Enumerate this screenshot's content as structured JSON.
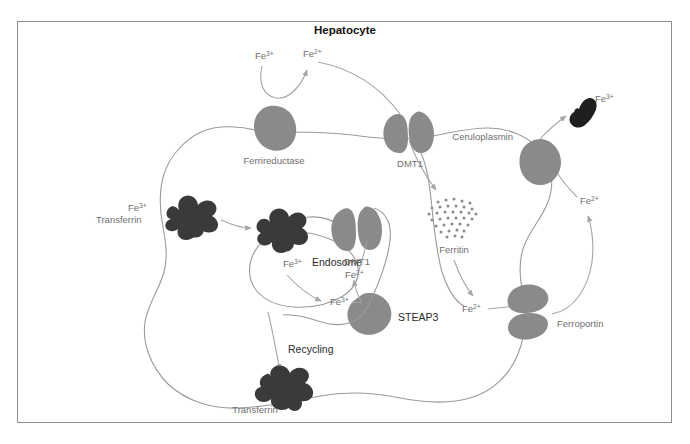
{
  "figure": {
    "title": "Hepatocyte",
    "caption": ""
  },
  "colors": {
    "protein_gray": "#8a8a8a",
    "transferrin_dark": "#3a3a3a",
    "membrane_line": "#9a9a9a",
    "arrow_line": "#a0a0a0",
    "label_gray": "#6f6f6f",
    "label_dark": "#2b2b2b",
    "frame_border": "#8d8d8d",
    "background": "#ffffff"
  },
  "proteins": [
    {
      "id": "ferrireductase",
      "label": "Ferrireductase",
      "icon": "protein-blob-icon"
    },
    {
      "id": "dmt1-membrane",
      "label": "DMT1",
      "icon": "channel-protein-icon"
    },
    {
      "id": "ceruloplasmin",
      "label": "Ceruloplasmin",
      "icon": "protein-blob-icon"
    },
    {
      "id": "ferroportin",
      "label": "Ferroportin",
      "icon": "channel-protein-icon"
    },
    {
      "id": "dmt1-endosome",
      "label": "DMT1",
      "icon": "channel-protein-icon"
    },
    {
      "id": "steap3",
      "label": "STEAP3",
      "icon": "protein-blob-icon"
    },
    {
      "id": "ferritin",
      "label": "Ferritin",
      "icon": "dot-cluster-icon"
    }
  ],
  "structures": [
    {
      "id": "endosome",
      "label": "Endosome",
      "icon": "endosome-outline-icon"
    },
    {
      "id": "transferrin-extracellular",
      "label": "Transferrin",
      "icon": "transferrin-icon"
    },
    {
      "id": "transferrin-recycled",
      "label": "Transferrin",
      "icon": "transferrin-icon"
    },
    {
      "id": "transferrin-exported",
      "label": "",
      "icon": "transferrin-icon"
    }
  ],
  "ion_labels": {
    "fe3_extracellular_apical": "Fe3+",
    "fe2_reduced_apical": "Fe2+",
    "fe3_transferrin_bound": "Fe3+",
    "fe3_in_endosome": "Fe3+",
    "fe3_endosome_lumen": "Fe3+",
    "fe2_endosome_export": "Fe2+",
    "fe2_cytosolic_pool": "Fe2+",
    "fe2_exported": "Fe2+",
    "fe3_oxidized_export": "Fe3+"
  },
  "ion_text": {
    "fe3": "Fe",
    "fe3_sup": "3+",
    "fe2": "Fe",
    "fe2_sup": "2+"
  },
  "processes": [
    {
      "id": "recycling",
      "label": "Recycling"
    }
  ],
  "pathway_steps": [
    "Extracellular Fe3+ is reduced to Fe2+ by Ferrireductase at the plasma membrane",
    "Fe2+ enters the hepatocyte through DMT1",
    "Fe3+-Transferrin binds its receptor and is internalized into the Endosome",
    "Endosomal Fe3+ is reduced to Fe2+ by STEAP3",
    "Endosomal Fe2+ exits via DMT1 into the cytosolic labile iron pool",
    "Cytosolic Fe2+ is stored in Ferritin",
    "Fe2+ is exported by Ferroportin",
    "Ceruloplasmin oxidizes Fe2+ to Fe3+ for loading onto Transferrin",
    "Apo-transferrin is returned to the circulation by Recycling"
  ]
}
